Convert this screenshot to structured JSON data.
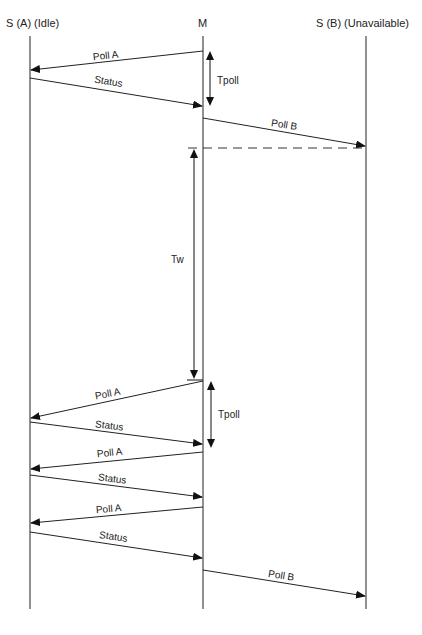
{
  "diagram": {
    "type": "sequence",
    "participants": [
      {
        "id": "A",
        "label": "S (A) (Idle)",
        "x": 30
      },
      {
        "id": "M",
        "label": "M",
        "x": 203
      },
      {
        "id": "B",
        "label": "S (B) (Unavailable)",
        "x": 366
      }
    ],
    "messages": [
      {
        "label": "Poll A",
        "from": "M",
        "to": "A",
        "y1": 51,
        "y2": 70
      },
      {
        "label": "Status",
        "from": "A",
        "to": "M",
        "y1": 78,
        "y2": 106
      },
      {
        "label": "Poll B",
        "from": "M",
        "to": "B",
        "y1": 118,
        "y2": 146
      },
      {
        "label": "Poll A",
        "from": "M",
        "to": "A",
        "y1": 381,
        "y2": 418
      },
      {
        "label": "Status",
        "from": "A",
        "to": "M",
        "y1": 422,
        "y2": 444
      },
      {
        "label": "Poll A",
        "from": "M",
        "to": "A",
        "y1": 452,
        "y2": 469
      },
      {
        "label": "Status",
        "from": "A",
        "to": "M",
        "y1": 475,
        "y2": 497
      },
      {
        "label": "Poll A",
        "from": "M",
        "to": "A",
        "y1": 507,
        "y2": 523
      },
      {
        "label": "Status",
        "from": "A",
        "to": "M",
        "y1": 532,
        "y2": 558
      },
      {
        "label": "Poll B",
        "from": "M",
        "to": "B",
        "y1": 570,
        "y2": 596
      }
    ],
    "intervals": [
      {
        "label": "Tpoll",
        "y1": 51,
        "y2": 106
      },
      {
        "label": "Tw",
        "y1": 148,
        "y2": 380
      },
      {
        "label": "Tpoll",
        "y1": 381,
        "y2": 448
      }
    ],
    "timeout_line_label": ""
  },
  "labels": {
    "participant_a": "S (A) (Idle)",
    "participant_m": "M",
    "participant_b": "S (B) (Unavailable)",
    "msg1": "Poll A",
    "msg2": "Status",
    "msg3": "Poll B",
    "msg4": "Poll A",
    "msg5": "Status",
    "msg6": "Poll A",
    "msg7": "Status",
    "msg8": "Poll A",
    "msg9": "Status",
    "msg10": "Poll B",
    "tpoll1": "Tpoll",
    "tw": "Tw",
    "tpoll2": "Tpoll"
  }
}
